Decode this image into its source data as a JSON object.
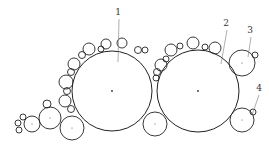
{
  "figure": {
    "labels": [
      {
        "id": "1",
        "text": "1",
        "x": 118,
        "y": 15,
        "lx1": 119,
        "ly1": 19,
        "lx2": 118,
        "ly2": 62
      },
      {
        "id": "2",
        "text": "2",
        "x": 226,
        "y": 26,
        "lx1": 227,
        "ly1": 30,
        "lx2": 221,
        "ly2": 64
      },
      {
        "id": "3",
        "text": "3",
        "x": 250,
        "y": 33,
        "lx1": 251,
        "ly1": 37,
        "lx2": 248,
        "ly2": 57
      },
      {
        "id": "4",
        "text": "4",
        "x": 259,
        "y": 91,
        "lx1": 259,
        "ly1": 95,
        "lx2": 252,
        "ly2": 115
      }
    ],
    "big_circles": [
      {
        "name": "circle-1",
        "cx": 112,
        "cy": 91,
        "r": 40
      },
      {
        "name": "circle-2",
        "cx": 198,
        "cy": 91,
        "r": 41
      }
    ],
    "medium_circles": [
      {
        "name": "circle-3",
        "cx": 242,
        "cy": 63,
        "r": 13
      },
      {
        "name": "circle-4",
        "cx": 242,
        "cy": 120,
        "r": 12
      },
      {
        "name": "circle-bottom-middle",
        "cx": 155,
        "cy": 124,
        "r": 12
      },
      {
        "name": "circle-bottom-left-a",
        "cx": 72,
        "cy": 128,
        "r": 12
      },
      {
        "name": "circle-bottom-left-b",
        "cx": 50,
        "cy": 118,
        "r": 11
      },
      {
        "name": "circle-bottom-left-c",
        "cx": 32,
        "cy": 124,
        "r": 8
      }
    ],
    "small_circles": [
      {
        "cx": 122,
        "cy": 43,
        "r": 5
      },
      {
        "cx": 106,
        "cy": 44,
        "r": 5
      },
      {
        "cx": 101,
        "cy": 49,
        "r": 3
      },
      {
        "cx": 89,
        "cy": 49,
        "r": 6
      },
      {
        "cx": 82,
        "cy": 55,
        "r": 3.5
      },
      {
        "cx": 74,
        "cy": 64,
        "r": 6
      },
      {
        "cx": 71,
        "cy": 72,
        "r": 3.5
      },
      {
        "cx": 66,
        "cy": 82,
        "r": 7
      },
      {
        "cx": 67,
        "cy": 91,
        "r": 3.5
      },
      {
        "cx": 65,
        "cy": 101,
        "r": 6
      },
      {
        "cx": 71,
        "cy": 109,
        "r": 3.5
      },
      {
        "cx": 47,
        "cy": 104,
        "r": 4
      },
      {
        "cx": 23,
        "cy": 117,
        "r": 3
      },
      {
        "cx": 18,
        "cy": 123,
        "r": 3
      },
      {
        "cx": 19,
        "cy": 130,
        "r": 3
      },
      {
        "cx": 138,
        "cy": 50,
        "r": 3.5
      },
      {
        "cx": 145,
        "cy": 50,
        "r": 3
      },
      {
        "cx": 171,
        "cy": 50,
        "r": 6
      },
      {
        "cx": 180,
        "cy": 46,
        "r": 3
      },
      {
        "cx": 193,
        "cy": 43,
        "r": 6
      },
      {
        "cx": 205,
        "cy": 47,
        "r": 3
      },
      {
        "cx": 215,
        "cy": 48,
        "r": 6
      },
      {
        "cx": 161,
        "cy": 65,
        "r": 6
      },
      {
        "cx": 166,
        "cy": 59,
        "r": 3
      },
      {
        "cx": 157,
        "cy": 72,
        "r": 3.5
      },
      {
        "cx": 156,
        "cy": 78,
        "r": 3
      },
      {
        "cx": 255,
        "cy": 55,
        "r": 3
      },
      {
        "cx": 253,
        "cy": 112,
        "r": 3
      }
    ]
  }
}
